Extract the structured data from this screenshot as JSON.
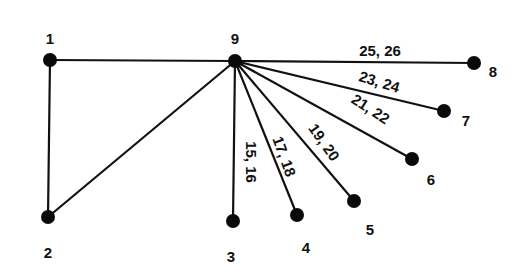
{
  "diagram": {
    "type": "graph",
    "style": {
      "line_color": "#111111",
      "node_color": "#0a0a0a",
      "background": "#ffffff"
    },
    "nodes": [
      {
        "id": "1",
        "label": "1",
        "x": 50,
        "y": 60,
        "lx": 50,
        "ly": 40
      },
      {
        "id": "2",
        "label": "2",
        "x": 48,
        "y": 217,
        "lx": 48,
        "ly": 254
      },
      {
        "id": "3",
        "label": "3",
        "x": 233,
        "y": 221,
        "lx": 231,
        "ly": 258
      },
      {
        "id": "4",
        "label": "4",
        "x": 297,
        "y": 215,
        "lx": 306,
        "ly": 249
      },
      {
        "id": "5",
        "label": "5",
        "x": 354,
        "y": 201,
        "lx": 370,
        "ly": 231
      },
      {
        "id": "6",
        "label": "6",
        "x": 412,
        "y": 159,
        "lx": 431,
        "ly": 181
      },
      {
        "id": "7",
        "label": "7",
        "x": 444,
        "y": 111,
        "lx": 466,
        "ly": 122
      },
      {
        "id": "8",
        "label": "8",
        "x": 474,
        "y": 63,
        "lx": 493,
        "ly": 73
      },
      {
        "id": "9",
        "label": "9",
        "x": 235,
        "y": 61,
        "lx": 235,
        "ly": 40
      }
    ],
    "edges": [
      {
        "from": "1",
        "to": "9",
        "label": ""
      },
      {
        "from": "1",
        "to": "2",
        "label": ""
      },
      {
        "from": "2",
        "to": "9",
        "label": ""
      },
      {
        "from": "9",
        "to": "3",
        "label": "15, 16",
        "lx": 250,
        "ly": 162,
        "rot": 90
      },
      {
        "from": "9",
        "to": "4",
        "label": "17, 18",
        "lx": 283,
        "ly": 157,
        "rot": 70
      },
      {
        "from": "9",
        "to": "5",
        "label": "19, 20",
        "lx": 323,
        "ly": 143,
        "rot": 55
      },
      {
        "from": "9",
        "to": "6",
        "label": "21, 22",
        "lx": 370,
        "ly": 110,
        "rot": 33
      },
      {
        "from": "9",
        "to": "7",
        "label": "23, 24",
        "lx": 379,
        "ly": 83,
        "rot": 17
      },
      {
        "from": "9",
        "to": "8",
        "label": "25, 26",
        "lx": 380,
        "ly": 52,
        "rot": 0
      }
    ]
  }
}
